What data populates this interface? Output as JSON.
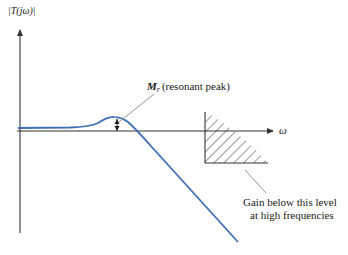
{
  "figure": {
    "type": "frequency-response-magnitude-sketch",
    "y_axis_label": "|T(jω)|",
    "x_axis_label": "ω",
    "peak_annotation": {
      "symbol": "M",
      "subscript": "r",
      "description": "(resonant peak)"
    },
    "region_annotation": {
      "line1": "Gain below this level",
      "line2": "at high frequencies"
    },
    "colors": {
      "curve": "#3f6fb5",
      "axes": "#333333",
      "leader": "#888888",
      "hatch": "#333333",
      "text": "#1a1a1a"
    }
  }
}
